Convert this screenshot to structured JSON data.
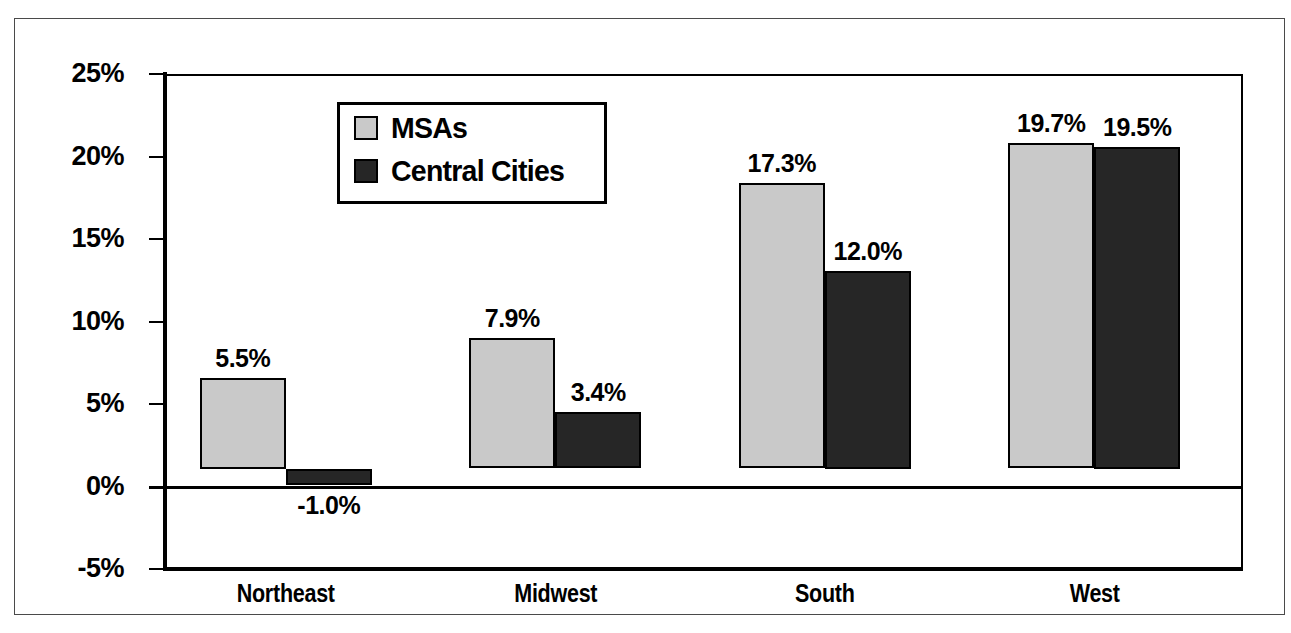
{
  "chart_data": {
    "type": "bar",
    "title": "",
    "subtitle": "",
    "xlabel": "",
    "ylabel": "",
    "categories": [
      "Northeast",
      "Midwest",
      "South",
      "West"
    ],
    "series": [
      {
        "name": "MSAs",
        "color": "#c9c9c9",
        "values": [
          5.5,
          7.9,
          17.3,
          19.7
        ],
        "labels": [
          "5.5%",
          "7.9%",
          "17.3%",
          "19.7%"
        ]
      },
      {
        "name": "Central Cities",
        "color": "#262626",
        "values": [
          -1.0,
          3.4,
          12.0,
          19.5
        ],
        "labels": [
          "-1.0%",
          "3.4%",
          "12.0%",
          "19.5%"
        ]
      }
    ],
    "ylim": [
      -5,
      25
    ],
    "ytick_values": [
      25,
      20,
      15,
      10,
      5,
      0,
      -5
    ],
    "ytick_labels": [
      "25%",
      "20%",
      "15%",
      "10%",
      "5%",
      "0%",
      "-5%"
    ],
    "grid": true,
    "gridline_color": "#d6d6d6",
    "zero_line": 0,
    "legend_position": "inside-upper-left",
    "legend_entries": [
      "MSAs",
      "Central Cities"
    ],
    "value_label_unit": "%"
  },
  "legend": {
    "items": [
      {
        "label": "MSAs",
        "swatch": "light-gray-square"
      },
      {
        "label": "Central Cities",
        "swatch": "dark-square"
      }
    ]
  },
  "axis": {
    "y_labels": [
      "25%",
      "20%",
      "15%",
      "10%",
      "5%",
      "0%",
      "-5%"
    ],
    "x_labels": [
      "Northeast",
      "Midwest",
      "South",
      "West"
    ]
  },
  "values": {
    "northeast_msas": "5.5%",
    "northeast_central": "-1.0%",
    "midwest_msas": "7.9%",
    "midwest_central": "3.4%",
    "south_msas": "17.3%",
    "south_central": "12.0%",
    "west_msas": "19.7%",
    "west_central": "19.5%"
  }
}
